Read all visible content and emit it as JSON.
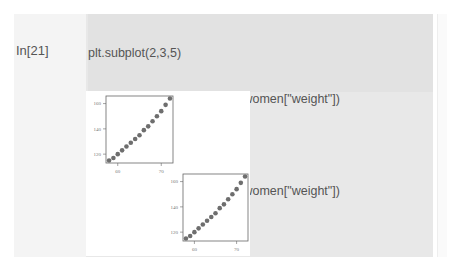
{
  "cell": {
    "prompt": "In[21]",
    "code_lines": [
      "plt.subplot(2,3,5)",
      "plt.scatter(women[\"height\"], women[\"weight\"])",
      "plt.subplot(2,3,1)",
      "plt.scatter(women[\"height\"], women[\"weight\"])",
      "plt.show()"
    ]
  },
  "colors": {
    "cell_background": "#e2e2e2",
    "marker": "#6e6e6e",
    "axis": "#666666"
  },
  "chart_data": [
    {
      "type": "scatter",
      "subplot": "2,3,1",
      "title": "",
      "xlabel": "",
      "ylabel": "",
      "x": [
        58,
        59,
        60,
        61,
        62,
        63,
        64,
        65,
        66,
        67,
        68,
        69,
        70,
        71,
        72
      ],
      "y": [
        115,
        117,
        120,
        123,
        126,
        129,
        132,
        135,
        139,
        142,
        146,
        150,
        154,
        159,
        164
      ],
      "x_ticks": [
        "60",
        "70"
      ],
      "y_ticks": [
        "120",
        "140",
        "160"
      ],
      "grid": false
    },
    {
      "type": "scatter",
      "subplot": "2,3,5",
      "title": "",
      "xlabel": "",
      "ylabel": "",
      "x": [
        58,
        59,
        60,
        61,
        62,
        63,
        64,
        65,
        66,
        67,
        68,
        69,
        70,
        71,
        72
      ],
      "y": [
        115,
        117,
        120,
        123,
        126,
        129,
        132,
        135,
        139,
        142,
        146,
        150,
        154,
        159,
        164
      ],
      "x_ticks": [
        "60",
        "70"
      ],
      "y_ticks": [
        "120",
        "140",
        "160"
      ],
      "grid": false
    }
  ]
}
